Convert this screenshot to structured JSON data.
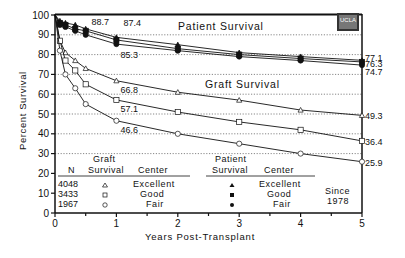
{
  "chart_data": {
    "type": "line",
    "title": "",
    "xlabel": "Years Post-Transplant",
    "ylabel": "Percent Survival",
    "xlim": [
      0,
      5
    ],
    "ylim": [
      0,
      100
    ],
    "x_ticks": [
      "0",
      "1",
      "2",
      "3",
      "4",
      "5"
    ],
    "y_ticks": [
      "0",
      "10",
      "20",
      "30",
      "40",
      "50",
      "60",
      "70",
      "80",
      "90",
      "100"
    ],
    "grid": "horizontal dotted at 30-90",
    "section_labels": {
      "patient": "Patient Survival",
      "graft": "Graft Survival"
    },
    "x": [
      0,
      0.08,
      0.17,
      0.33,
      0.5,
      1,
      2,
      3,
      4,
      5
    ],
    "series": [
      {
        "name": "Patient Survival - Excellent",
        "group": "patient",
        "marker": "filled-triangle",
        "values": [
          100,
          97,
          96,
          95,
          93,
          88.7,
          85,
          81,
          79,
          77.1
        ]
      },
      {
        "name": "Patient Survival - Good",
        "group": "patient",
        "marker": "filled-square",
        "values": [
          100,
          96,
          95,
          93,
          92,
          87.4,
          83,
          80,
          78,
          76.3
        ]
      },
      {
        "name": "Patient Survival - Fair",
        "group": "patient",
        "marker": "filled-circle",
        "values": [
          100,
          95,
          94,
          92,
          90,
          85.3,
          82,
          79,
          77,
          74.7
        ]
      },
      {
        "name": "Graft Survival - Excellent",
        "group": "graft",
        "marker": "open-triangle",
        "values": [
          100,
          87,
          81,
          77,
          73,
          66.8,
          61,
          57,
          52,
          49.3
        ]
      },
      {
        "name": "Graft Survival - Good",
        "group": "graft",
        "marker": "open-square",
        "values": [
          100,
          87,
          77,
          72,
          65,
          57.1,
          51,
          46,
          42,
          36.4
        ]
      },
      {
        "name": "Graft Survival - Fair",
        "group": "graft",
        "marker": "open-circle",
        "values": [
          100,
          82,
          70,
          63,
          55,
          46.6,
          40,
          35,
          30,
          25.9
        ]
      }
    ],
    "annotations": [
      {
        "text": "88.7",
        "x": 1,
        "y": 88.7
      },
      {
        "text": "87.4",
        "x": 1,
        "y": 87.4
      },
      {
        "text": "85.3",
        "x": 1,
        "y": 85.3
      },
      {
        "text": "66.8",
        "x": 1,
        "y": 66.8
      },
      {
        "text": "57.1",
        "x": 1,
        "y": 57.1
      },
      {
        "text": "46.6",
        "x": 1,
        "y": 46.6
      },
      {
        "text": "77.1",
        "x": 5,
        "y": 77.1
      },
      {
        "text": "76.3",
        "x": 5,
        "y": 76.3
      },
      {
        "text": "74.7",
        "x": 5,
        "y": 74.7
      },
      {
        "text": "49.3",
        "x": 5,
        "y": 49.3
      },
      {
        "text": "36.4",
        "x": 5,
        "y": 36.4
      },
      {
        "text": "25.9",
        "x": 5,
        "y": 25.9
      }
    ],
    "legend": {
      "position": "bottom-inside",
      "graft_header": [
        "N",
        "Graft Survival",
        "Center"
      ],
      "patient_header": [
        "Patient Survival",
        "Center"
      ],
      "rows": [
        {
          "n": "4048",
          "center": "Excellent",
          "graft_marker": "△",
          "patient_marker": "▲"
        },
        {
          "n": "3433",
          "center": "Good",
          "graft_marker": "□",
          "patient_marker": "■"
        },
        {
          "n": "1967",
          "center": "Fair",
          "graft_marker": "○",
          "patient_marker": "●"
        }
      ],
      "note": "Since 1978"
    },
    "logo": "UCLA"
  },
  "labels": {
    "patient_title": "Patient Survival",
    "graft_title": "Graft Survival",
    "xlabel": "Years Post-Transplant",
    "ylabel": "Percent Survival",
    "legend_n": "N",
    "legend_graft_1": "Graft",
    "legend_graft_2": "Survival",
    "legend_center": "Center",
    "legend_patient_1": "Patient",
    "legend_patient_2": "Survival",
    "legend_center_2": "Center",
    "since_1": "Since",
    "since_2": "1978",
    "n_excellent": "4048",
    "n_good": "3433",
    "n_fair": "1967",
    "c_excellent": "Excellent",
    "c_good": "Good",
    "c_fair": "Fair",
    "c_excellent_2": "Excellent",
    "c_good_2": "Good",
    "c_fair_2": "Fair",
    "logo": "UCLA"
  }
}
